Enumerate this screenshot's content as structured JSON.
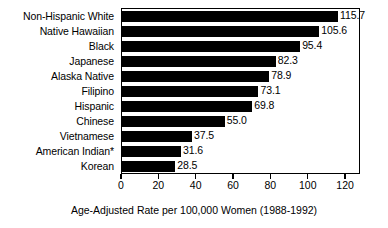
{
  "chart_data": {
    "type": "bar",
    "orientation": "horizontal",
    "title": "",
    "subtitle": "",
    "xlabel": "Age-Adjusted Rate per 100,000 Women (1988-1992)",
    "ylabel": "",
    "xlim": [
      0,
      128
    ],
    "ylim": null,
    "grid": false,
    "legend": null,
    "bar_color": "#000000",
    "categories": [
      "Non-Hispanic White",
      "Native Hawaiian",
      "Black",
      "Japanese",
      "Alaska Native",
      "Filipino",
      "Hispanic",
      "Chinese",
      "Vietnamese",
      "American Indian*",
      "Korean"
    ],
    "values": [
      115.7,
      105.6,
      95.4,
      82.3,
      78.9,
      73.1,
      69.8,
      55.0,
      37.5,
      31.6,
      28.5
    ],
    "value_labels": [
      "115.7",
      "105.6",
      "95.4",
      "82.3",
      "78.9",
      "73.1",
      "69.8",
      "55.0",
      "37.5",
      "31.6",
      "28.5"
    ],
    "xticks": [
      0,
      20,
      40,
      60,
      80,
      100,
      120
    ],
    "xtick_labels": [
      "0",
      "20",
      "40",
      "60",
      "80",
      "100",
      "120"
    ],
    "footnote_marker": "*"
  },
  "caption": {
    "text": "Age-Adjusted Rate per 100,000 Women (1988-1992)"
  },
  "colors": {
    "bar": "#000000",
    "axis": "#000000",
    "background": "#ffffff",
    "text": "#000000"
  }
}
